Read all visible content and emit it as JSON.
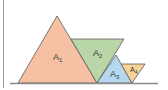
{
  "diagram": {
    "colors": {
      "A1": "#f6c0a3",
      "A2": "#b8d6a8",
      "A3": "#b5d8ee",
      "A4": "#f7d19a",
      "stroke": "#5a5a5a",
      "baseline": "#8a8a8a",
      "frame": "#9a9a9a"
    },
    "triangles": [
      {
        "id": "A1",
        "base": "A",
        "sub": "1"
      },
      {
        "id": "A2",
        "base": "A",
        "sub": "2"
      },
      {
        "id": "A3",
        "base": "A",
        "sub": "3"
      },
      {
        "id": "A4",
        "base": "A",
        "sub": "4"
      }
    ]
  }
}
